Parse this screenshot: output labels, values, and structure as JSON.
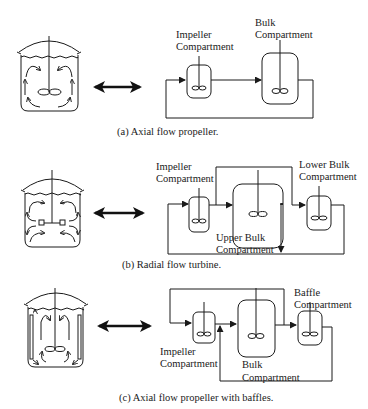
{
  "figure": {
    "panels": [
      {
        "id": "a",
        "caption": "(a) Axial flow propeller.",
        "vessel": "axial-flow-propeller-vessel",
        "compartments": [
          {
            "label_line1": "Impeller",
            "label_line2": "Compartment"
          },
          {
            "label_line1": "Bulk",
            "label_line2": "Compartment"
          }
        ]
      },
      {
        "id": "b",
        "caption": "(b) Radial flow turbine.",
        "vessel": "radial-flow-turbine-vessel",
        "compartments": [
          {
            "label_line1": "Impeller",
            "label_line2": "Compartment"
          },
          {
            "label_line1": "Upper Bulk",
            "label_line2": "Compartment"
          },
          {
            "label_line1": "Lower Bulk",
            "label_line2": "Compartment"
          }
        ]
      },
      {
        "id": "c",
        "caption": "(c) Axial flow propeller with baffles.",
        "vessel": "baffled-axial-propeller-vessel",
        "compartments": [
          {
            "label_line1": "Impeller",
            "label_line2": "Compartment"
          },
          {
            "label_line1": "Bulk",
            "label_line2": "Compartment"
          },
          {
            "label_line1": "Baffle",
            "label_line2": "Compartment"
          }
        ]
      }
    ],
    "icons": {
      "equivalence_arrow": "double-headed-arrow",
      "impeller": "propeller-figure-eight"
    },
    "colors": {
      "ink": "#1a1a1a",
      "background": "#ffffff"
    }
  }
}
